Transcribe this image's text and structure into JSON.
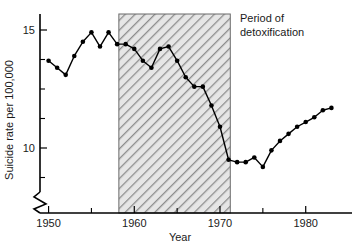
{
  "chart_data": {
    "type": "line",
    "title": "",
    "xlabel": "Year",
    "ylabel": "Suicide rate per 100,000",
    "xlim": [
      1949,
      1984
    ],
    "ylim": [
      8.0,
      15.6
    ],
    "grid": false,
    "legend_position": "none",
    "y_axis_broken": true,
    "x_ticks_major": [
      1950,
      1960,
      1970,
      1980
    ],
    "x_tick_labels": [
      "1950",
      "1960",
      "1970",
      "1980"
    ],
    "x_ticks_minor": [
      1955,
      1965,
      1975
    ],
    "y_ticks_major": [
      10,
      15
    ],
    "y_tick_labels": [
      "10",
      "15"
    ],
    "y_ticks_minor": [
      8.75,
      11.25,
      12.5,
      13.75
    ],
    "annotations": [
      {
        "name": "period-of-detoxification",
        "text_line1": "Period of",
        "text_line2": "detoxification",
        "x_start": 1958.2,
        "x_end": 1971.2,
        "shading": "diagonal-hatch",
        "shading_color": "#9a9a9a",
        "fill_color": "#e2e2e2"
      }
    ],
    "series": [
      {
        "name": "Suicide rate",
        "marker": "filled-circle",
        "color": "#000000",
        "x": [
          1950,
          1951,
          1952,
          1953,
          1954,
          1955,
          1956,
          1957,
          1958,
          1959,
          1960,
          1961,
          1962,
          1963,
          1964,
          1965,
          1966,
          1967,
          1968,
          1969,
          1970,
          1971,
          1972,
          1973,
          1974,
          1975,
          1976,
          1977,
          1978,
          1979,
          1980,
          1981,
          1982,
          1983
        ],
        "values": [
          13.7,
          13.4,
          13.1,
          13.9,
          14.5,
          14.9,
          14.3,
          14.9,
          14.4,
          14.4,
          14.2,
          13.7,
          13.4,
          14.2,
          14.3,
          13.7,
          13.0,
          12.6,
          12.6,
          11.8,
          10.9,
          9.5,
          9.4,
          9.4,
          9.6,
          9.2,
          9.9,
          10.3,
          10.6,
          10.9,
          11.1,
          11.3,
          11.6,
          11.7
        ]
      }
    ]
  }
}
